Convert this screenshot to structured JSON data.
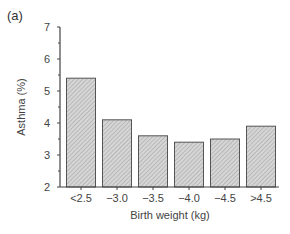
{
  "panel_label": "(a)",
  "colors": {
    "bar_fill": "#c8c8c8",
    "bar_stroke": "#555555",
    "axis": "#444444"
  },
  "chart_data": {
    "type": "bar",
    "title": "",
    "categories": [
      "<2.5",
      "−3.0",
      "−3.5",
      "−4.0",
      "−4.5",
      ">4.5"
    ],
    "values": [
      5.4,
      4.1,
      3.6,
      3.4,
      3.5,
      3.9
    ],
    "xlabel": "Birth weight (kg)",
    "ylabel": "Asthma (%)",
    "ylim": [
      2,
      7
    ],
    "yticks": [
      2,
      3,
      4,
      5,
      6,
      7
    ],
    "grid": false,
    "legend": null,
    "bar_pattern": "hatched grey"
  }
}
